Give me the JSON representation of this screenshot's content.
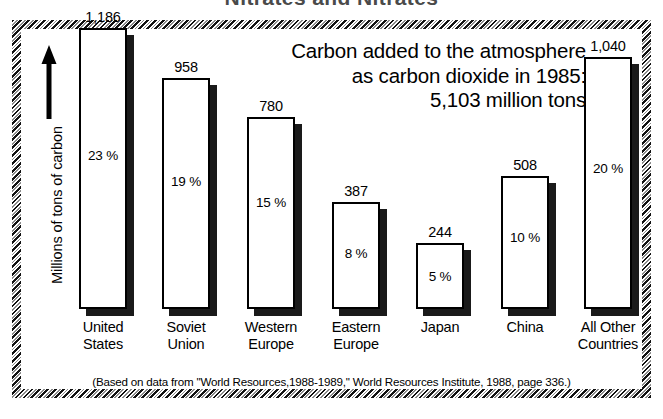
{
  "top_cut_title": "Nitrates and Nitrates",
  "axis": {
    "y_label": "Millions of tons of carbon",
    "arrow_icon": "up-arrow-icon"
  },
  "title": {
    "line1": "Carbon added to the atmosphere",
    "line2": "as carbon dioxide in 1985:",
    "line3": "5,103 million tons"
  },
  "caption": "(Based on data from \"World Resources,1988-1989,\" World Resources Institute, 1988, page 336.)",
  "colors": {
    "bar_fill": "#ffffff",
    "bar_outline": "#000000",
    "bar_shadow": "#1a1a1a",
    "background": "#ffffff",
    "text": "#000000"
  },
  "chart_data": {
    "type": "bar",
    "title": "Carbon added to the atmosphere as carbon dioxide in 1985: 5,103 million tons",
    "xlabel": "",
    "ylabel": "Millions of tons of carbon",
    "ylim": [
      0,
      1186
    ],
    "grid": false,
    "legend": "none",
    "total": 5103,
    "units": "million tons of carbon",
    "year": 1985,
    "categories": [
      "United States",
      "Soviet Union",
      "Western Europe",
      "Eastern Europe",
      "Japan",
      "China",
      "All Other Countries"
    ],
    "values": [
      1186,
      958,
      780,
      387,
      244,
      508,
      1040
    ],
    "value_labels": [
      "1,186",
      "958",
      "780",
      "387",
      "244",
      "508",
      "1,040"
    ],
    "percent_labels": [
      "23 %",
      "19 %",
      "15 %",
      "8 %",
      "5 %",
      "10 %",
      "20 %"
    ],
    "percents": [
      23,
      19,
      15,
      8,
      5,
      10,
      20
    ]
  },
  "bars": [
    {
      "name": "united-states",
      "value_label": "1,186",
      "pct_label": "23 %",
      "label_line1": "United",
      "label_line2": "States",
      "left": 58,
      "width": 48,
      "height": 281,
      "pct_offset": 120
    },
    {
      "name": "soviet-union",
      "value_label": "958",
      "pct_label": "19 %",
      "label_line1": "Soviet",
      "label_line2": "Union",
      "left": 141,
      "width": 48,
      "height": 231,
      "pct_offset": 96
    },
    {
      "name": "western-europe",
      "value_label": "780",
      "pct_label": "15 %",
      "label_line1": "Western",
      "label_line2": "Europe",
      "left": 226,
      "width": 48,
      "height": 192,
      "pct_offset": 78
    },
    {
      "name": "eastern-europe",
      "value_label": "387",
      "pct_label": "8 %",
      "label_line1": "Eastern",
      "label_line2": "Europe",
      "left": 311,
      "width": 48,
      "height": 107,
      "pct_offset": 44
    },
    {
      "name": "japan",
      "value_label": "244",
      "pct_label": "5 %",
      "label_line1": "Japan",
      "label_line2": "",
      "left": 395,
      "width": 48,
      "height": 66,
      "pct_offset": 26
    },
    {
      "name": "china",
      "value_label": "508",
      "pct_label": "10 %",
      "label_line1": "China",
      "label_line2": "",
      "left": 480,
      "width": 48,
      "height": 133,
      "pct_offset": 54
    },
    {
      "name": "all-other-countries",
      "value_label": "1,040",
      "pct_label": "20 %",
      "label_line1": "All Other",
      "label_line2": "Countries",
      "left": 563,
      "width": 48,
      "height": 252,
      "pct_offset": 104
    }
  ]
}
